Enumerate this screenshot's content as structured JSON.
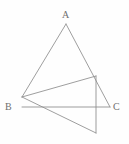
{
  "figure": {
    "background_color": "#fefefe",
    "line_color": "#8d8d8d",
    "label_color": "#6f6f6f",
    "labels": [
      {
        "id": "A",
        "text": "A",
        "x": 62,
        "y": 10
      },
      {
        "id": "B",
        "text": "B",
        "x": 5,
        "y": 102
      },
      {
        "id": "C",
        "text": "C",
        "x": 113,
        "y": 102
      }
    ],
    "points": {
      "A": {
        "x": 66,
        "y": 24
      },
      "B": {
        "x": 22,
        "y": 107
      },
      "C": {
        "x": 110,
        "y": 107
      },
      "D": {
        "x": 22,
        "y": 97
      },
      "E": {
        "x": 96,
        "y": 76
      },
      "F": {
        "x": 96,
        "y": 133
      }
    },
    "segments": [
      {
        "name": "side-A-to-D",
        "from": "A",
        "to": "D"
      },
      {
        "name": "side-A-to-C",
        "from": "A",
        "to": "C"
      },
      {
        "name": "base-B-to-C",
        "from": "B",
        "to": "C"
      },
      {
        "name": "segment-D-to-E",
        "from": "D",
        "to": "E"
      },
      {
        "name": "vertical-E-to-F",
        "from": "E",
        "to": "F"
      },
      {
        "name": "diagonal-D-to-F",
        "from": "D",
        "to": "F"
      }
    ]
  }
}
